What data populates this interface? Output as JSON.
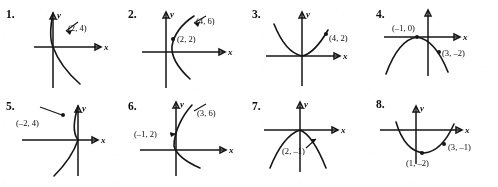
{
  "page": {
    "kind": "math-exercise-figure-set",
    "background_color": "#ffffff",
    "ink_color": "#1a1a1a"
  },
  "axis_labels": {
    "x": "x",
    "y": "y"
  },
  "problems": [
    {
      "number": "1.",
      "curve": "parabola-opens-right-vertex-origin",
      "points": [
        {
          "label": "(2, 4)"
        }
      ]
    },
    {
      "number": "2.",
      "curve": "parabola-opens-right-vertex-right-of-y-axis",
      "points": [
        {
          "label": "(4, 6)"
        },
        {
          "label": "(2, 2)"
        }
      ]
    },
    {
      "number": "3.",
      "curve": "parabola-opens-up-vertex-origin",
      "points": [
        {
          "label": "(4, 2)"
        }
      ]
    },
    {
      "number": "4.",
      "curve": "parabola-opens-down-vertex-on-x-axis",
      "points": [
        {
          "label": "(–1, 0)"
        },
        {
          "label": "(3, –2)"
        }
      ]
    },
    {
      "number": "5.",
      "curve": "parabola-opens-left-vertex-origin",
      "points": [
        {
          "label": "(–2, 4)"
        }
      ]
    },
    {
      "number": "6.",
      "curve": "parabola-opens-right-vertex-origin",
      "points": [
        {
          "label": "(3, 6)"
        },
        {
          "label": "(–1, 2)"
        }
      ]
    },
    {
      "number": "7.",
      "curve": "parabola-opens-down-vertex-origin",
      "points": [
        {
          "label": "(2, –1)"
        }
      ]
    },
    {
      "number": "8.",
      "curve": "parabola-opens-up-vertex-below-x-axis",
      "points": [
        {
          "label": "(3, –1)"
        },
        {
          "label": "(1, –2)"
        }
      ]
    }
  ]
}
